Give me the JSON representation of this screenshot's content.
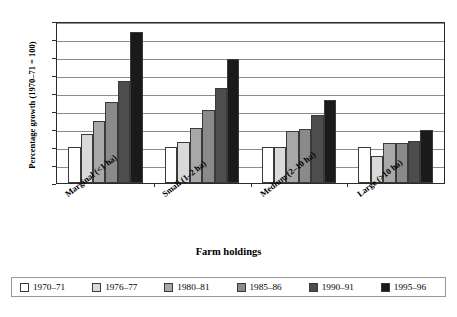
{
  "chart_data": {
    "type": "bar",
    "title": "",
    "xlabel": "Farm holdings",
    "ylabel": "Percentage growth (1970–71 = 100)",
    "ylim": [
      0,
      450
    ],
    "yticks": [
      0,
      50,
      100,
      150,
      200,
      250,
      300,
      350,
      400,
      450
    ],
    "ytick_labels": [
      "0",
      "50",
      "100",
      "150",
      "200",
      "250",
      "300",
      "350",
      "400",
      "450"
    ],
    "grid": true,
    "legend_position": "bottom",
    "categories": [
      "Marginal (<1 ha)",
      "Small (1–2 ha)",
      "Medium (2–10 ha)",
      "Large (>10 ha)"
    ],
    "series": [
      {
        "name": "1970–71",
        "color": "#ffffff",
        "values": [
          100,
          100,
          100,
          100
        ]
      },
      {
        "name": "1976–77",
        "color": "#d9d9d9",
        "values": [
          135,
          115,
          100,
          75
        ]
      },
      {
        "name": "1980–81",
        "color": "#a8a8a8",
        "values": [
          172,
          153,
          145,
          110
        ]
      },
      {
        "name": "1985–86",
        "color": "#8a8a8a",
        "values": [
          226,
          204,
          150,
          112
        ]
      },
      {
        "name": "1990–91",
        "color": "#4d4d4d",
        "values": [
          282,
          263,
          190,
          118
        ]
      },
      {
        "name": "1995–96",
        "color": "#1a1a1a",
        "values": [
          420,
          345,
          230,
          147
        ]
      }
    ]
  },
  "axis": {
    "y_title": "Percentage growth (1970–71 = 100)",
    "x_title": "Farm holdings"
  }
}
